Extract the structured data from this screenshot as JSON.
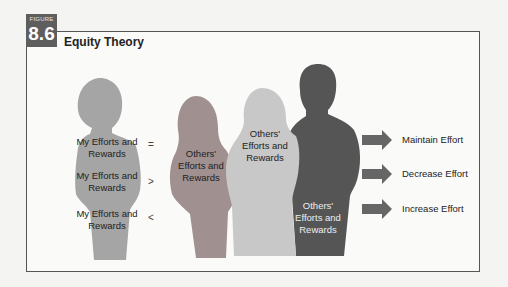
{
  "figure": {
    "label": "FIGURE",
    "number": "8.6",
    "title": "Equity Theory"
  },
  "left_person": {
    "texts": [
      "My Efforts and Rewards",
      "My Efforts and Rewards",
      "My Efforts and Rewards"
    ]
  },
  "comparisons": [
    "=",
    ">",
    "<"
  ],
  "others": [
    {
      "text": "Others' Efforts and Rewards",
      "color": "#a09090"
    },
    {
      "text": "Others' Efforts and Rewards",
      "color": "#c8c8c8"
    },
    {
      "text": "Others' Efforts and Rewards",
      "color": "#555555"
    }
  ],
  "outcomes": [
    "Maintain Effort",
    "Decrease Effort",
    "Increase Effort"
  ],
  "colors": {
    "left_person": "#a5a5a5",
    "badge": "#5e5e5e",
    "arrow": "#666666"
  }
}
